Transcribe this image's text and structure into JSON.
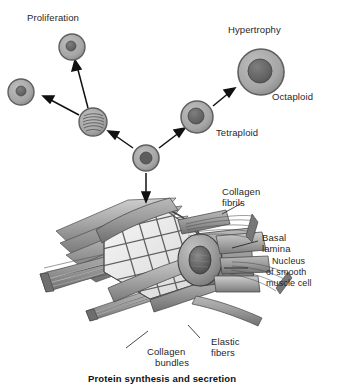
{
  "figure": {
    "caption": "Protein synthesis and secretion"
  },
  "pathway_labels": {
    "proliferation": "Proliferation",
    "hypertrophy": "Hypertrophy",
    "tetraploid": "Tetraploid",
    "octaploid": "Octaploid"
  },
  "structure_labels": {
    "collagen_fibrils": "Collagen\nfibrils",
    "collagen_fibrils_line1": "Collagen",
    "collagen_fibrils_line2": "fibrils",
    "basal_lamina_line1": "Basal",
    "basal_lamina_line2": "lamina",
    "nucleus_line1": "Nucleus",
    "nucleus_line2": "of smooth",
    "nucleus_line3": "muscle cell",
    "collagen_bundles_line1": "Collagen",
    "collagen_bundles_line2": "bundles",
    "elastic_fibers_line1": "Elastic",
    "elastic_fibers_line2": "fibers"
  },
  "colors": {
    "ink": "#1b1b1b",
    "cell_cytoplasm": "#a9a9a9",
    "cell_membrane": "#6f6f6f",
    "nucleus": "#6b6b6b",
    "nucleus_dark": "#585858",
    "muscle_fiber": "#9a9a9a",
    "muscle_fiber_dark": "#767676",
    "basal_lamina_mesh": "#efefef",
    "mesh_line": "#6a6a6a",
    "background": "#ffffff"
  },
  "cells": [
    {
      "name": "daughter-cell-left",
      "cx": 21,
      "cy": 92,
      "r": 13,
      "nucleus_r": 5,
      "type": "diploid"
    },
    {
      "name": "daughter-cell-top",
      "cx": 72,
      "cy": 47,
      "r": 13,
      "nucleus_r": 5,
      "type": "diploid"
    },
    {
      "name": "mitotic-cell",
      "cx": 93,
      "cy": 122,
      "r": 14,
      "nucleus_r": 0,
      "type": "mitotic"
    },
    {
      "name": "parent-cell",
      "cx": 146,
      "cy": 158,
      "r": 13,
      "nucleus_r": 6,
      "type": "diploid"
    },
    {
      "name": "tetraploid-cell",
      "cx": 197,
      "cy": 117,
      "r": 16,
      "nucleus_r": 8,
      "type": "tetraploid"
    },
    {
      "name": "octaploid-cell",
      "cx": 261,
      "cy": 72,
      "r": 23,
      "nucleus_r": 12,
      "type": "octaploid"
    }
  ]
}
